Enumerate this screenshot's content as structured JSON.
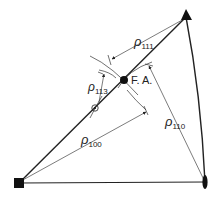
{
  "diagram": {
    "title": "",
    "labels": {
      "rho_symbol": "ρ",
      "rho_111_sub": "111",
      "rho_113_sub": "113",
      "rho_100_sub": "100",
      "rho_110_sub": "110",
      "fiber_axis": "F. A."
    },
    "vertices": [
      {
        "name": "square-pole-100",
        "shape": "square",
        "x": 19,
        "y": 183
      },
      {
        "name": "triangle-pole-111",
        "shape": "triangle",
        "x": 186,
        "y": 17
      },
      {
        "name": "lens-pole-110",
        "shape": "lens",
        "x": 205,
        "y": 182
      }
    ],
    "points": [
      {
        "name": "fiber-axis-point",
        "x": 124,
        "y": 80
      },
      {
        "name": "pole-113-point",
        "x": 95,
        "y": 108
      }
    ],
    "colors": {
      "line": "#222222",
      "background": "#ffffff"
    }
  }
}
